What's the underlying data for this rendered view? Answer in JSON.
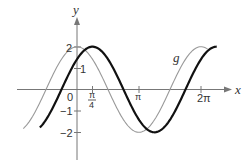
{
  "chart_data": {
    "type": "line",
    "title": "",
    "xlabel": "x",
    "ylabel": "y",
    "x_ticks": [
      {
        "value": 0.7854,
        "label_num": "π",
        "label_den": "4"
      },
      {
        "value": 3.1416,
        "label": "π"
      },
      {
        "value": 6.2832,
        "label": "2π"
      }
    ],
    "y_ticks": [
      {
        "value": 2,
        "label": "2"
      },
      {
        "value": 1,
        "label": "1"
      },
      {
        "value": -1,
        "label": "−1"
      },
      {
        "value": -2,
        "label": "−2"
      }
    ],
    "origin_label": "0",
    "grid": false,
    "series": [
      {
        "name": "g",
        "expr": "2cos(x)",
        "amplitude": 2,
        "phase": 0,
        "x_range": [
          -2.72,
          6.62
        ],
        "color": "#999999",
        "width": 1.1
      },
      {
        "name": "f",
        "expr": "2cos(x − π/4)",
        "amplitude": 2,
        "phase": 0.7854,
        "x_range": [
          -1.88,
          7.08
        ],
        "color": "#111111",
        "width": 2.2
      }
    ],
    "annotations": [
      {
        "text": "g",
        "x": 5.0,
        "y": 1.65
      }
    ],
    "xlim": [
      -3.2,
      7.5
    ],
    "ylim": [
      -2.8,
      2.5
    ]
  },
  "labels": {
    "x_axis": "x",
    "y_axis": "y",
    "origin": "0",
    "tick_pi_over_4_num": "π",
    "tick_pi_over_4_den": "4",
    "tick_pi": "π",
    "tick_2pi": "2π",
    "tick_y2": "2",
    "tick_y1": "1",
    "tick_ym1": "−1",
    "tick_ym2": "−2",
    "curve_g": "g"
  }
}
